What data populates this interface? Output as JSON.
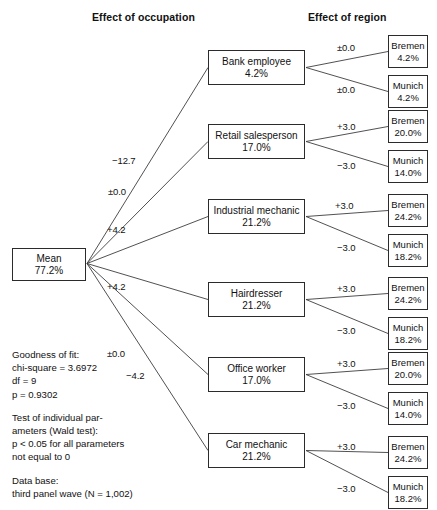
{
  "figure": {
    "clipped_title": "Conditional effects",
    "headers": {
      "occupation": "Effect of occupation",
      "region": "Effect of region"
    }
  },
  "chart_data": {
    "type": "diagram",
    "title": "Conditional effects",
    "diagram_kind": "tree / chaid-style effect decomposition",
    "root": {
      "label": "Mean",
      "value": "77.2%"
    },
    "level1_header": "Effect of occupation",
    "level2_header": "Effect of region",
    "branches": [
      {
        "effect": "−12.7",
        "label": "Bank employee",
        "value": "4.2%",
        "children": [
          {
            "effect": "±0.0",
            "label": "Bremen",
            "value": "4.2%"
          },
          {
            "effect": "±0.0",
            "label": "Munich",
            "value": "4.2%"
          }
        ]
      },
      {
        "effect": "±0.0",
        "label": "Retail salesperson",
        "value": "17.0%",
        "children": [
          {
            "effect": "+3.0",
            "label": "Bremen",
            "value": "20.0%"
          },
          {
            "effect": "−3.0",
            "label": "Munich",
            "value": "14.0%"
          }
        ]
      },
      {
        "effect": "+4.2",
        "label": "Industrial mechanic",
        "value": "21.2%",
        "children": [
          {
            "effect": "+3.0",
            "label": "Bremen",
            "value": "24.2%"
          },
          {
            "effect": "−3.0",
            "label": "Munich",
            "value": "18.2%"
          }
        ]
      },
      {
        "effect": "+4.2",
        "label": "Hairdresser",
        "value": "21.2%",
        "children": [
          {
            "effect": "+3.0",
            "label": "Bremen",
            "value": "24.2%"
          },
          {
            "effect": "−3.0",
            "label": "Munich",
            "value": "18.2%"
          }
        ]
      },
      {
        "effect": "±0.0",
        "label": "Office worker",
        "value": "17.0%",
        "children": [
          {
            "effect": "+3.0",
            "label": "Bremen",
            "value": "20.0%"
          },
          {
            "effect": "−3.0",
            "label": "Munich",
            "value": "14.0%"
          }
        ]
      },
      {
        "effect": "−4.2",
        "label": "Car mechanic",
        "value": "21.2%",
        "children": [
          {
            "effect": "+3.0",
            "label": "Bremen",
            "value": "24.2%"
          },
          {
            "effect": "−3.0",
            "label": "Munich",
            "value": "18.2%"
          }
        ]
      }
    ]
  },
  "notes": {
    "goodness_of_fit": {
      "heading": "Goodness of fit:",
      "lines": [
        "chi-square = 3.6972",
        "df = 9",
        "p = 0.9302"
      ]
    },
    "wald_test": {
      "lines": [
        "Test of individual par-",
        "ameters (Wald test):",
        "p < 0.05 for all parameters",
        "not equal to 0"
      ]
    },
    "data_base": {
      "heading": "Data base:",
      "lines": [
        "third panel wave (N = 1,002)"
      ]
    }
  },
  "colors": {
    "background": "#ffffff",
    "text": "#111111",
    "box_border": "#2b2b2b",
    "edge": "#3d3d3d"
  }
}
